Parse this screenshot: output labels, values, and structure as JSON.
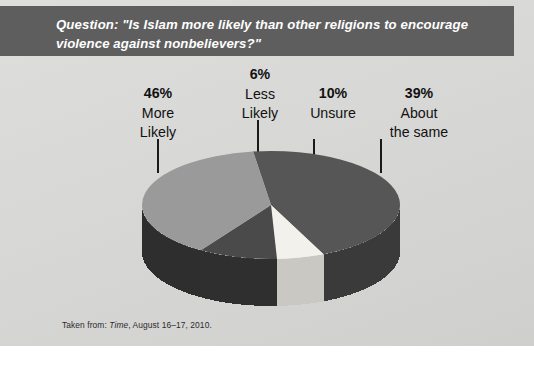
{
  "banner": {
    "question": "Question: \"Is Islam more likely than other religions to encourage violence against nonbelievers?\"",
    "background_color": "#5e5e5e",
    "text_color": "#ffffff"
  },
  "labels": {
    "more_likely": {
      "pct": "46%",
      "line1": "More",
      "line2": "Likely"
    },
    "less_likely": {
      "pct": "6%",
      "line1": "Less",
      "line2": "Likely"
    },
    "unsure": {
      "pct": "10%",
      "line1": "Unsure",
      "line2": ""
    },
    "about_same": {
      "pct": "39%",
      "line1": "About",
      "line2": "the same"
    }
  },
  "credit": {
    "prefix": "Taken from: ",
    "source": "Time",
    "suffix": ", August 16–17, 2010."
  },
  "chart_data": {
    "type": "pie",
    "title": "Question: \"Is Islam more likely than other religions to encourage violence against nonbelievers?\"",
    "xlabel": "",
    "ylabel": "",
    "legend_position": "none",
    "grid": false,
    "three_d": true,
    "units": "percent",
    "total": 101,
    "categories": [
      "More Likely",
      "Less Likely",
      "Unsure",
      "About the same"
    ],
    "values": [
      46,
      6,
      10,
      39
    ],
    "labels": [
      "46% More Likely",
      "6% Less Likely",
      "10% Unsure",
      "39% About the same"
    ],
    "colors": [
      "#565656",
      "#f2f1ec",
      "#4a4a4a",
      "#9a9a9a"
    ],
    "side_colors": [
      "#3a3a3a",
      "#c9c8c3",
      "#2f2f2f",
      "#2e2e2e"
    ],
    "start_angle_deg": 262,
    "direction": "clockwise",
    "annotations": [
      "Taken from: Time, August 16–17, 2010."
    ]
  },
  "palette": {
    "panel_background": "#d8d8d6",
    "page_background": "#ffffff",
    "text": "#111111",
    "leader_line": "#1a1a1a"
  }
}
